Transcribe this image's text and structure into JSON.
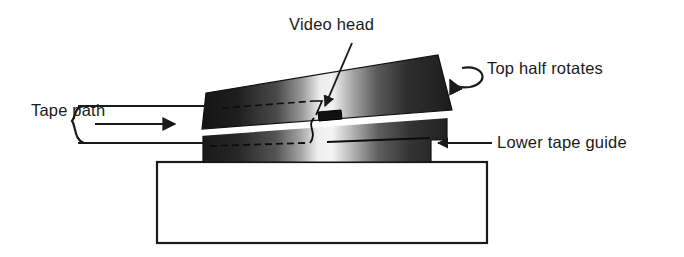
{
  "figure": {
    "background_color": "#ffffff",
    "ink_color": "#1a1a1a"
  },
  "labels": {
    "video_head": "Video head",
    "top_half_rotates": "Top half rotates",
    "tape_path": "Tape path",
    "lower_tape_guide": "Lower tape guide"
  },
  "parts": {
    "upper_drum": {
      "name": "upper rotating drum",
      "gradient_stops": [
        "#141414",
        "#2a2a2a",
        "#6e6e6e",
        "#e8e8e8",
        "#f2f2f2",
        "#8a8a8a",
        "#3a3a3a",
        "#1c1c1c"
      ]
    },
    "tape_gap": {
      "name": "tape gap",
      "color": "#ffffff"
    },
    "lower_drum": {
      "name": "lower tape guide drum",
      "gradient_stops": [
        "#1a1a1a",
        "#333333",
        "#7a7a7a",
        "#ededed",
        "#f4f4f4",
        "#8e8e8e",
        "#3d3d3d",
        "#222222"
      ]
    },
    "video_head_chip": {
      "name": "video head chip",
      "color": "#101010"
    },
    "base_block": {
      "name": "base block",
      "fill": "#ffffff",
      "stroke": "#1a1a1a"
    }
  },
  "annotations": {
    "rotation_arrow": "curved-rotation-arrow",
    "tape_direction_arrow": "tape-direction-arrow",
    "tape_bracket": "tape-path-bracket",
    "video_head_leader": "video-head-leader-line",
    "lower_guide_leader": "lower-tape-guide-leader-line"
  }
}
